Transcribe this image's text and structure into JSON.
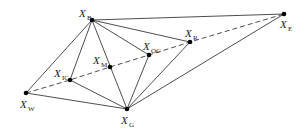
{
  "diagram": {
    "points": [
      {
        "id": "B",
        "label": "X",
        "sub": "B",
        "x": 92,
        "y": 20,
        "lx": 79,
        "ly": 17,
        "sx": 87,
        "sy": 20
      },
      {
        "id": "W",
        "label": "X",
        "sub": "W",
        "x": 26,
        "y": 93,
        "lx": 20,
        "ly": 108,
        "sx": 28,
        "sy": 111
      },
      {
        "id": "G",
        "label": "X",
        "sub": "G",
        "x": 127,
        "y": 109,
        "lx": 121,
        "ly": 124,
        "sx": 129,
        "sy": 127
      },
      {
        "id": "E",
        "label": "X",
        "sub": "E",
        "x": 284,
        "y": 14,
        "lx": 280,
        "ly": 28,
        "sx": 288,
        "sy": 31
      },
      {
        "id": "R",
        "label": "X",
        "sub": "R",
        "x": 190,
        "y": 42,
        "lx": 185,
        "ly": 37,
        "sx": 193,
        "sy": 40
      },
      {
        "id": "IC",
        "label": "X",
        "sub": "IC",
        "x": 70,
        "y": 80,
        "lx": 54,
        "ly": 77,
        "sx": 62,
        "sy": 80
      },
      {
        "id": "OC",
        "label": "X",
        "sub": "OC",
        "x": 149,
        "y": 55,
        "lx": 143,
        "ly": 50,
        "sx": 151,
        "sy": 53
      },
      {
        "id": "M",
        "label": "X",
        "sub": "M",
        "x": 110,
        "y": 67,
        "lx": 93,
        "ly": 64,
        "sx": 101,
        "sy": 67
      }
    ],
    "solid_edges": [
      [
        "B",
        "W"
      ],
      [
        "B",
        "IC"
      ],
      [
        "B",
        "G"
      ],
      [
        "B",
        "OC"
      ],
      [
        "B",
        "R"
      ],
      [
        "B",
        "E"
      ],
      [
        "G",
        "W"
      ],
      [
        "G",
        "IC"
      ],
      [
        "G",
        "OC"
      ],
      [
        "G",
        "R"
      ],
      [
        "G",
        "E"
      ]
    ],
    "dashed_path": [
      "W",
      "IC",
      "M",
      "OC",
      "R",
      "E"
    ],
    "colors": {
      "line": "#3a3a3a",
      "point": "#000000",
      "background": "#ffffff"
    }
  }
}
